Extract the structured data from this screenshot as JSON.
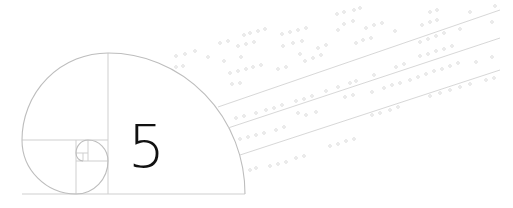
{
  "illustration": {
    "numeral": "5",
    "colors": {
      "background": "#ffffff",
      "numeral": "#111111",
      "spiral_lines": "#bdbdbd",
      "streak_lines": "#cfcfcf",
      "dots": "#d6d6d6"
    },
    "icons": [
      "golden-spiral-icon",
      "data-stream-lines"
    ]
  }
}
